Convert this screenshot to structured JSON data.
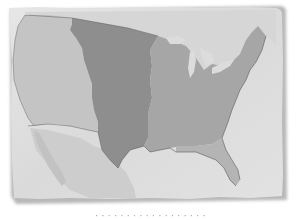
{
  "map": {
    "title": "United States territorial map",
    "style": "grayscale on torn paper",
    "colors": {
      "background": "#ffffff",
      "paper": "#dedede",
      "paper_shadow": "#b8b8b8",
      "water": "#e4e4e4",
      "western_region": "#c4c4c4",
      "central_region": "#8e8e8e",
      "eastern_region": "#a6a6a6",
      "florida_region": "#b4b4b4",
      "mexico": "#cdcdcd",
      "canada": "#d6d6d6",
      "great_lakes": "#dcdcdc",
      "border_line": "#5a5a5a"
    },
    "regions": [
      {
        "name": "Western territory",
        "shade": "light"
      },
      {
        "name": "Central territory",
        "shade": "dark"
      },
      {
        "name": "Eastern states",
        "shade": "medium"
      },
      {
        "name": "Florida",
        "shade": "medium-light"
      }
    ]
  },
  "caption": {
    "text": "· · ·  ·  · ·  ·  · · ·  ·  ·  · ·  ·  · · ·"
  }
}
